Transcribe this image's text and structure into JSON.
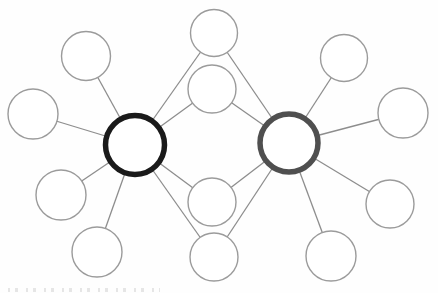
{
  "figure": {
    "kind": "network-diagram",
    "background_color": "#fefefe",
    "caption_fragment_note": "top sliver of cropped, illegible caption text at bottom-left"
  },
  "chart_data": {
    "type": "graph",
    "node_default": {
      "fill": "#ffffff",
      "stroke": "#9b9b9b",
      "stroke_width": 1.4
    },
    "edge_style": {
      "color": "#8d8d8d",
      "width": 1.3
    },
    "nodes": [
      {
        "id": "hub-left",
        "x": 135,
        "y": 145,
        "r": 29.5,
        "stroke": "#1a1a1a",
        "stroke_width": 5.5,
        "role": "hub"
      },
      {
        "id": "hub-right",
        "x": 289,
        "y": 143,
        "r": 29,
        "stroke": "#4f4f4f",
        "stroke_width": 5.5,
        "role": "hub"
      },
      {
        "id": "left-top",
        "x": 86,
        "y": 56,
        "r": 24.5,
        "role": "leaf"
      },
      {
        "id": "left-far",
        "x": 33,
        "y": 114,
        "r": 25,
        "role": "leaf"
      },
      {
        "id": "left-lower",
        "x": 61,
        "y": 195,
        "r": 25,
        "role": "leaf"
      },
      {
        "id": "left-bottom",
        "x": 97,
        "y": 252,
        "r": 25,
        "role": "leaf"
      },
      {
        "id": "mid-top",
        "x": 214,
        "y": 33,
        "r": 23.5,
        "role": "shared"
      },
      {
        "id": "mid-upper",
        "x": 212,
        "y": 89,
        "r": 24,
        "role": "shared"
      },
      {
        "id": "mid-lower",
        "x": 212,
        "y": 202,
        "r": 24,
        "role": "shared"
      },
      {
        "id": "mid-bottom",
        "x": 214,
        "y": 257,
        "r": 24,
        "role": "shared"
      },
      {
        "id": "right-top",
        "x": 344,
        "y": 58,
        "r": 23.5,
        "role": "leaf"
      },
      {
        "id": "right-far-upper",
        "x": 403,
        "y": 113,
        "r": 25,
        "role": "leaf"
      },
      {
        "id": "right-far-lower",
        "x": 390,
        "y": 204,
        "r": 24,
        "role": "leaf"
      },
      {
        "id": "right-bottom",
        "x": 331,
        "y": 256,
        "r": 25,
        "role": "leaf"
      }
    ],
    "edges": [
      [
        "hub-left",
        "left-top"
      ],
      [
        "hub-left",
        "left-far"
      ],
      [
        "hub-left",
        "left-lower"
      ],
      [
        "hub-left",
        "left-bottom"
      ],
      [
        "hub-left",
        "mid-top"
      ],
      [
        "hub-left",
        "mid-upper"
      ],
      [
        "hub-left",
        "mid-lower"
      ],
      [
        "hub-left",
        "mid-bottom"
      ],
      [
        "hub-right",
        "mid-top"
      ],
      [
        "hub-right",
        "mid-upper"
      ],
      [
        "hub-right",
        "mid-lower"
      ],
      [
        "hub-right",
        "mid-bottom"
      ],
      [
        "hub-right",
        "right-top"
      ],
      [
        "hub-right",
        "right-far-upper"
      ],
      [
        "hub-right",
        "right-far-lower"
      ],
      [
        "hub-right",
        "right-bottom"
      ]
    ],
    "canvas": {
      "width": 438,
      "height": 293
    }
  }
}
